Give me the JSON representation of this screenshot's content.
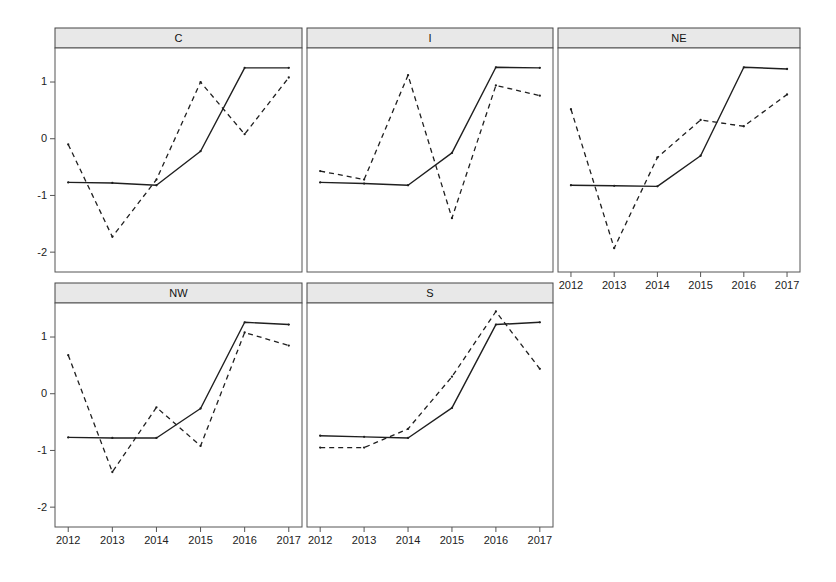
{
  "chart_data": {
    "type": "line",
    "title": "",
    "subtitle": "",
    "xlabel": "",
    "ylabel": "",
    "layout": "trellis 3x2 lattice panels, shared axes",
    "grid": false,
    "legend_position": "none",
    "x": [
      2012,
      2013,
      2014,
      2015,
      2016,
      2017
    ],
    "xticklabels": [
      "2012",
      "2013",
      "2014",
      "2015",
      "2016",
      "2017"
    ],
    "xlim": [
      2011.7,
      2017.3
    ],
    "ylim": [
      -2.35,
      1.6
    ],
    "yticks": [
      1,
      0,
      -1,
      -2
    ],
    "yticklabels": [
      "1",
      "0",
      "-1",
      "-2"
    ],
    "panels": [
      {
        "label": "C",
        "row": 0,
        "col": 0,
        "series": [
          {
            "name": "solid",
            "style": "solid",
            "values": [
              -0.77,
              -0.78,
              -0.82,
              -0.22,
              1.25,
              1.25
            ]
          },
          {
            "name": "dashed",
            "style": "dashed",
            "values": [
              -0.1,
              -1.73,
              -0.72,
              1.0,
              0.08,
              1.08
            ]
          }
        ]
      },
      {
        "label": "I",
        "row": 0,
        "col": 1,
        "series": [
          {
            "name": "solid",
            "style": "solid",
            "values": [
              -0.77,
              -0.79,
              -0.82,
              -0.25,
              1.26,
              1.25
            ]
          },
          {
            "name": "dashed",
            "style": "dashed",
            "values": [
              -0.57,
              -0.72,
              1.12,
              -1.4,
              0.94,
              0.76
            ]
          }
        ]
      },
      {
        "label": "NE",
        "row": 0,
        "col": 2,
        "series": [
          {
            "name": "solid",
            "style": "solid",
            "values": [
              -0.82,
              -0.83,
              -0.84,
              -0.3,
              1.26,
              1.23
            ]
          },
          {
            "name": "dashed",
            "style": "dashed",
            "values": [
              0.52,
              -1.93,
              -0.33,
              0.33,
              0.22,
              0.78
            ]
          }
        ]
      },
      {
        "label": "NW",
        "row": 1,
        "col": 0,
        "series": [
          {
            "name": "solid",
            "style": "solid",
            "values": [
              -0.77,
              -0.78,
              -0.78,
              -0.26,
              1.26,
              1.22
            ]
          },
          {
            "name": "dashed",
            "style": "dashed",
            "values": [
              0.68,
              -1.38,
              -0.24,
              -0.92,
              1.08,
              0.85
            ]
          }
        ]
      },
      {
        "label": "S",
        "row": 1,
        "col": 1,
        "series": [
          {
            "name": "solid",
            "style": "solid",
            "values": [
              -0.74,
              -0.76,
              -0.78,
              -0.25,
              1.22,
              1.26
            ]
          },
          {
            "name": "dashed",
            "style": "dashed",
            "values": [
              -0.95,
              -0.95,
              -0.62,
              0.3,
              1.45,
              0.44
            ]
          }
        ]
      }
    ]
  },
  "figure": {
    "background": "#ffffff",
    "line_color": "#1f1f1f",
    "strip_fill": "#e8e8e8",
    "strip_border": "#444444",
    "panel_border": "#555555",
    "axis_color": "#555555"
  }
}
